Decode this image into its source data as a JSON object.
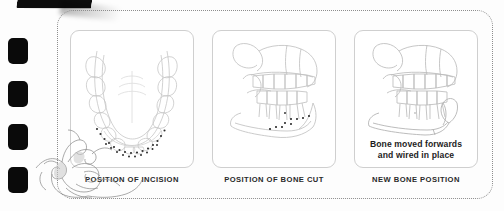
{
  "page": {
    "background_color": "#fdfdfd",
    "border_style": "dotted-rounded-rectangle",
    "border_color": "#8d8d8d",
    "binding_mark_color": "#0a0a0a",
    "binding_mark_count": 4,
    "ornament_name": "acanthus-scroll-flourish"
  },
  "panels": [
    {
      "id": "panel-incision",
      "caption": "POSITION OF INCISION",
      "inpanel_text": "",
      "illustration": "occlusal-view-dental-arch-with-dotted-incision-line",
      "line_color": "#bdbdbd",
      "marker_color": "#2b2b2b"
    },
    {
      "id": "panel-bone-cut",
      "caption": "POSITION OF BONE CUT",
      "inpanel_text": "",
      "illustration": "lateral-view-jaw-with-dotted-bone-cut-line",
      "line_color": "#bdbdbd",
      "marker_color": "#2b2b2b"
    },
    {
      "id": "panel-new-position",
      "caption": "NEW BONE POSITION",
      "inpanel_text_line1": "Bone moved forwards",
      "inpanel_text_line2": "and wired in place",
      "illustration": "lateral-view-jaw-advanced-and-wired",
      "line_color": "#bdbdbd",
      "marker_color": "#2b2b2b"
    }
  ]
}
